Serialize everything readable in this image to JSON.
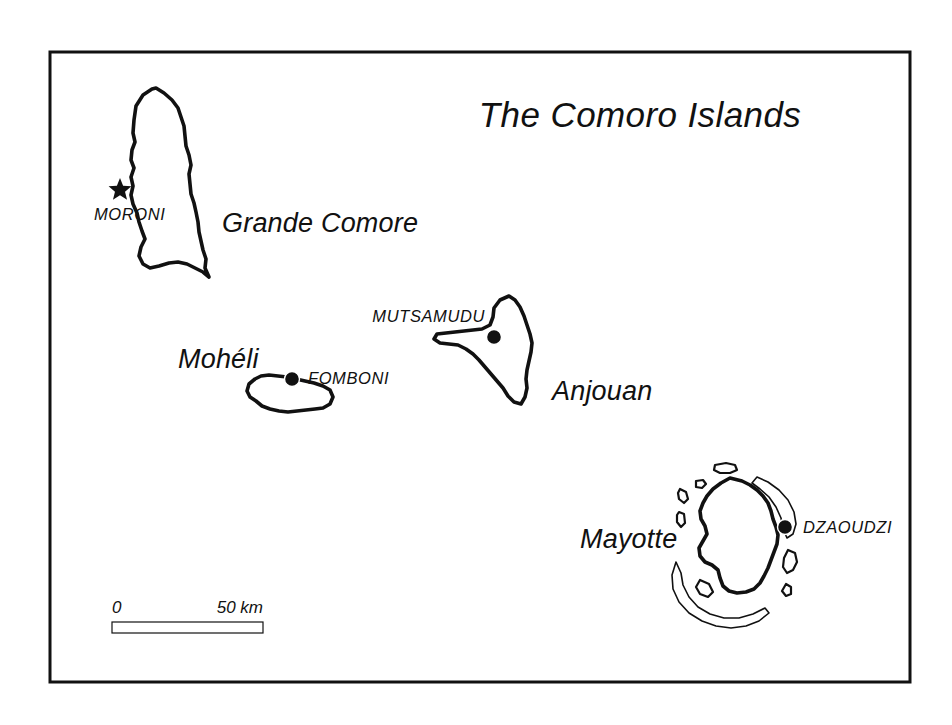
{
  "figure": {
    "kind": "reference-map",
    "title": "The Comoro Islands",
    "background_color": "#ffffff",
    "ink_color": "#111111",
    "frame": {
      "x": 50,
      "y": 52,
      "width": 860,
      "height": 630
    }
  },
  "title": {
    "text": "The Comoro Islands",
    "x": 640,
    "y": 127
  },
  "islands": [
    {
      "id": "grande-comore",
      "label": "Grande Comore",
      "label_x": 222,
      "label_y": 232,
      "coast_path": "M 152 89 L 143 95 L 136 106 L 134 120 L 133 133 L 135 142 L 132 150 L 131 160 L 134 168 L 131 177 L 133 186 L 131 195 L 133 204 L 137 213 L 139 222 L 142 231 L 145 239 L 141 247 L 139 256 L 143 264 L 150 268 L 159 266 L 169 263 L 178 262 L 187 264 L 195 268 L 203 272 L 209 277 L 205 268 L 206 259 L 203 250 L 201 241 L 199 232 L 198 222 L 196 212 L 194 203 L 191 194 L 190 184 L 189 174 L 191 165 L 189 155 L 186 146 L 185 136 L 184 126 L 181 117 L 178 108 L 172 100 L 164 93 L 156 88 Z"
    },
    {
      "id": "moheli",
      "label": "Mohéli",
      "label_x": 178,
      "label_y": 368,
      "coast_path": "M 255 379 L 249 384 L 247 391 L 250 397 L 256 401 L 262 406 L 270 409 L 279 411 L 288 412 L 297 411 L 306 410 L 315 409 L 323 408 L 330 404 L 333 397 L 330 390 L 323 386 L 314 383 L 305 381 L 296 379 L 287 377 L 278 376 L 269 375 L 261 376 Z"
    },
    {
      "id": "anjouan",
      "label": "Anjouan",
      "label_x": 552,
      "label_y": 400,
      "coast_path": "M 509 296 L 500 300 L 494 308 L 493 317 L 490 325 L 482 329 L 473 330 L 464 331 L 455 332 L 446 333 L 437 334 L 434 339 L 440 343 L 449 344 L 458 345 L 466 349 L 473 354 L 479 360 L 485 367 L 491 374 L 497 381 L 503 388 L 508 396 L 514 402 L 521 404 L 525 397 L 527 388 L 526 379 L 527 370 L 529 361 L 531 352 L 532 343 L 530 334 L 527 325 L 524 316 L 520 307 L 515 300 Z"
    },
    {
      "id": "mayotte",
      "label": "Mayotte",
      "label_x": 580,
      "label_y": 548,
      "coast_path": "M 730 478 L 721 483 L 713 489 L 707 496 L 703 503 L 700 511 L 701 519 L 705 526 L 707 534 L 703 541 L 699 548 L 700 556 L 705 562 L 712 565 L 718 570 L 720 578 L 723 586 L 729 591 L 737 593 L 746 592 L 754 589 L 760 583 L 764 576 L 768 568 L 771 560 L 774 552 L 777 544 L 778 535 L 776 527 L 773 519 L 771 511 L 768 503 L 763 496 L 757 490 L 750 485 L 742 481 Z",
      "reef_paths": [
        "M 757 477 L 768 482 L 779 490 L 788 500 L 794 512 L 796 524 L 793 534 L 787 538 L 783 529 L 781 518 L 776 507 L 769 497 L 760 489 L 752 483 Z",
        "M 676 562 L 672 575 L 673 589 L 679 602 L 689 613 L 702 621 L 716 626 L 731 628 L 746 626 L 759 621 L 769 613 L 765 608 L 753 614 L 739 618 L 724 618 L 710 614 L 698 607 L 689 597 L 683 585 L 681 573 Z"
      ],
      "islet_paths": [
        "M 715 465 L 726 463 L 735 465 L 737 470 L 730 473 L 720 473 L 714 470 Z",
        "M 696 481 L 703 480 L 706 484 L 702 488 L 696 487 Z",
        "M 680 489 L 686 492 L 688 499 L 684 503 L 679 499 L 678 493 Z",
        "M 679 512 L 684 514 L 685 523 L 681 527 L 677 522 L 677 515 Z",
        "M 788 550 L 795 553 L 797 562 L 793 570 L 787 573 L 783 567 L 784 558 Z",
        "M 786 584 L 791 587 L 791 594 L 786 596 L 782 591 Z",
        "M 700 580 L 709 584 L 713 592 L 708 597 L 700 594 L 696 587 Z"
      ]
    }
  ],
  "cities": [
    {
      "id": "moroni",
      "name": "MORONI",
      "type": "capital",
      "marker": "star-icon",
      "marker_x": 120,
      "marker_y": 190,
      "label_x": 94,
      "label_y": 220,
      "label_anchor": "start"
    },
    {
      "id": "fomboni",
      "name": "FOMBONI",
      "type": "town",
      "marker": "dot-icon",
      "marker_x": 292,
      "marker_y": 379,
      "label_x": 308,
      "label_y": 384,
      "label_anchor": "start"
    },
    {
      "id": "mutsamudu",
      "name": "MUTSAMUDU",
      "type": "town",
      "marker": "dot-icon",
      "marker_x": 494,
      "marker_y": 337,
      "label_x": 485,
      "label_y": 322,
      "label_anchor": "end"
    },
    {
      "id": "dzaoudzi",
      "name": "DZAOUDZI",
      "type": "town",
      "marker": "dot-icon",
      "marker_x": 785,
      "marker_y": 527,
      "label_x": 803,
      "label_y": 533,
      "label_anchor": "start"
    }
  ],
  "scale_bar": {
    "start_label": "0",
    "end_label": "50 km",
    "units": "km",
    "max_value": 50,
    "segments": 6,
    "bar_x": 112,
    "bar_y": 622,
    "bar_width": 151,
    "bar_height": 11,
    "start_label_x": 112,
    "start_label_y": 613,
    "end_label_x": 263,
    "end_label_y": 613
  }
}
